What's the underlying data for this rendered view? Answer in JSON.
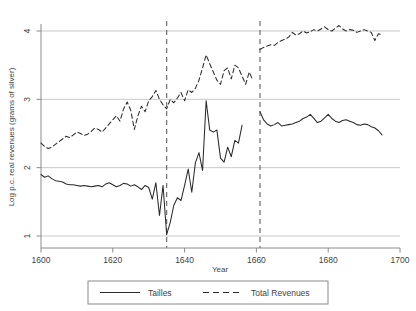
{
  "chart_data": {
    "type": "line",
    "title": "",
    "xlabel": "Year",
    "ylabel": "Log p.c. real revenues (grams of silver)",
    "xlim": [
      1600,
      1700
    ],
    "ylim": [
      1,
      4
    ],
    "xticks": [
      1600,
      1620,
      1640,
      1660,
      1680,
      1700
    ],
    "yticks": [
      1,
      2,
      3,
      4
    ],
    "xtick_labels": [
      "1600",
      "1620",
      "1640",
      "1660",
      "1680",
      "1700"
    ],
    "ytick_labels": [
      "1",
      "2",
      "3",
      "4"
    ],
    "grid": "horizontal",
    "legend_position": "below-center",
    "annotations": [
      {
        "name": "vertical-reference-line-1635",
        "type": "vline",
        "x": 1635,
        "style": "dashed"
      },
      {
        "name": "vertical-reference-line-1661",
        "type": "vline",
        "x": 1661,
        "style": "dashed"
      }
    ],
    "series": [
      {
        "name": "Tailles",
        "style": "solid",
        "color": "#2b2b2b",
        "x": [
          1600,
          1601,
          1602,
          1603,
          1604,
          1605,
          1606,
          1607,
          1608,
          1609,
          1610,
          1611,
          1612,
          1613,
          1614,
          1615,
          1616,
          1617,
          1618,
          1619,
          1620,
          1621,
          1622,
          1623,
          1624,
          1625,
          1626,
          1627,
          1628,
          1629,
          1630,
          1631,
          1632,
          1633,
          1634,
          1635,
          1636,
          1637,
          1638,
          1639,
          1640,
          1641,
          1642,
          1643,
          1644,
          1645,
          1646,
          1647,
          1648,
          1649,
          1650,
          1651,
          1652,
          1653,
          1654,
          1655,
          1656
        ],
        "values": [
          1.9,
          1.86,
          1.88,
          1.84,
          1.81,
          1.8,
          1.79,
          1.76,
          1.75,
          1.75,
          1.74,
          1.73,
          1.74,
          1.73,
          1.72,
          1.73,
          1.74,
          1.72,
          1.76,
          1.78,
          1.75,
          1.72,
          1.74,
          1.77,
          1.76,
          1.73,
          1.75,
          1.72,
          1.68,
          1.74,
          1.71,
          1.54,
          1.78,
          1.3,
          1.74,
          1.02,
          1.2,
          1.45,
          1.56,
          1.52,
          1.74,
          1.98,
          1.64,
          2.07,
          2.22,
          1.96,
          2.98,
          2.55,
          2.52,
          2.55,
          2.14,
          2.08,
          2.3,
          2.16,
          2.4,
          2.36,
          2.62
        ],
        "segments": [
          {
            "x": [
              1661,
              1662,
              1663,
              1664,
              1665,
              1666,
              1667,
              1668,
              1669,
              1670,
              1671,
              1672,
              1673,
              1674,
              1675,
              1676,
              1677,
              1678,
              1679,
              1680,
              1681,
              1682,
              1683,
              1684,
              1685,
              1686,
              1687,
              1688,
              1689,
              1690,
              1691,
              1692,
              1693,
              1694,
              1695
            ],
            "values": [
              2.82,
              2.7,
              2.64,
              2.61,
              2.63,
              2.66,
              2.61,
              2.62,
              2.63,
              2.64,
              2.66,
              2.68,
              2.72,
              2.74,
              2.78,
              2.72,
              2.66,
              2.68,
              2.73,
              2.78,
              2.72,
              2.68,
              2.66,
              2.69,
              2.7,
              2.68,
              2.66,
              2.63,
              2.62,
              2.64,
              2.63,
              2.6,
              2.58,
              2.54,
              2.48
            ]
          }
        ]
      },
      {
        "name": "Total Revenues",
        "style": "dashed",
        "color": "#2b2b2b",
        "x": [
          1600,
          1601,
          1602,
          1603,
          1604,
          1605,
          1606,
          1607,
          1608,
          1609,
          1610,
          1611,
          1612,
          1613,
          1614,
          1615,
          1616,
          1617,
          1618,
          1619,
          1620,
          1621,
          1622,
          1623,
          1624,
          1625,
          1626,
          1627,
          1628,
          1629,
          1630,
          1631,
          1632,
          1633,
          1634,
          1635,
          1636,
          1637,
          1638,
          1639,
          1640,
          1641,
          1642,
          1643,
          1644,
          1645,
          1646,
          1647,
          1648,
          1649,
          1650,
          1651,
          1652,
          1653,
          1654,
          1655,
          1656,
          1657,
          1658,
          1659
        ],
        "values": [
          2.36,
          2.31,
          2.28,
          2.3,
          2.34,
          2.38,
          2.42,
          2.46,
          2.44,
          2.48,
          2.52,
          2.5,
          2.47,
          2.49,
          2.53,
          2.58,
          2.56,
          2.52,
          2.58,
          2.64,
          2.7,
          2.76,
          2.68,
          2.86,
          2.96,
          2.84,
          2.56,
          2.76,
          2.9,
          2.82,
          2.98,
          3.04,
          3.13,
          3.0,
          2.92,
          2.86,
          3.0,
          2.95,
          3.02,
          3.1,
          2.98,
          3.14,
          3.1,
          3.16,
          3.28,
          3.46,
          3.65,
          3.52,
          3.4,
          3.28,
          3.22,
          3.42,
          3.46,
          3.3,
          3.5,
          3.46,
          3.34,
          3.22,
          3.4,
          3.28
        ],
        "segments": [
          {
            "x": [
              1661,
              1662,
              1663,
              1664,
              1665,
              1666,
              1667,
              1668,
              1669,
              1670,
              1671,
              1672,
              1673,
              1674,
              1675,
              1676,
              1677,
              1678,
              1679,
              1680,
              1681,
              1682,
              1683,
              1684,
              1685,
              1686,
              1687,
              1688,
              1689,
              1690,
              1691,
              1692,
              1693,
              1694,
              1695
            ],
            "values": [
              3.73,
              3.76,
              3.78,
              3.8,
              3.79,
              3.83,
              3.86,
              3.88,
              3.91,
              3.98,
              3.94,
              3.96,
              4.0,
              3.97,
              3.99,
              4.02,
              4.0,
              4.03,
              4.06,
              4.02,
              4.0,
              4.04,
              4.08,
              4.03,
              4.0,
              4.02,
              4.01,
              3.98,
              4.0,
              4.02,
              4.0,
              3.98,
              3.86,
              3.96,
              3.94
            ]
          }
        ]
      }
    ]
  },
  "legend": {
    "items": [
      {
        "label": "Tailles",
        "style": "solid"
      },
      {
        "label": "Total Revenues",
        "style": "dashed"
      }
    ]
  },
  "colors": {
    "line": "#2b2b2b",
    "grid": "#c9c9c9",
    "axis": "#8a8a8a",
    "reference": "#6e6e6e",
    "text": "#3f3f3f"
  }
}
